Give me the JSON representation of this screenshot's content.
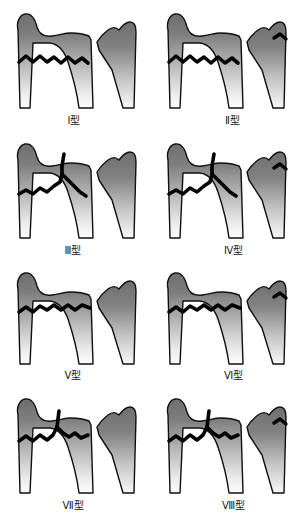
{
  "figure": {
    "title": "",
    "type": "anatomical-classification-diagram",
    "grid": {
      "columns": 2,
      "rows": 4
    },
    "colors": {
      "outline": "#101010",
      "fracture_line": "#000000",
      "bone_fill_top": "#7d7d7d",
      "bone_fill_bottom": "#ffffff",
      "background": "#ffffff",
      "label_text": "#1a1a1a"
    },
    "panels": [
      {
        "index": 1,
        "label": "Ⅰ型",
        "numeral": "Ⅰ",
        "fracture_description": "transverse jagged split across lateral plateau, single fragment",
        "fracture_path": "M 12,60 L 20,55 L 27,60 L 34,54 L 41,60 L 48,55 L 55,61 L 62,56 L 69,62 L 76,57 L 83,63 L 90,58 L 97,63 L 104,60",
        "fibula_fracture_path": ""
      },
      {
        "index": 2,
        "label": "Ⅱ型",
        "numeral": "Ⅱ",
        "fracture_description": "transverse plateau split plus associated fibular head fracture",
        "fracture_path": "M 12,60 L 20,55 L 27,60 L 34,54 L 41,60 L 48,55 L 55,61 L 62,56 L 69,62 L 76,57 L 83,63 L 90,58 L 97,63 L 104,60",
        "fibula_fracture_path": "M 124,38 L 131,34 L 138,39 L 144,35"
      },
      {
        "index": 3,
        "label": "Ⅲ型",
        "numeral": "Ⅲ",
        "fracture_description": "oblique medial split running up to the intercondylar eminence",
        "fracture_path": "M 12,62 L 20,58 L 27,62 L 34,57 L 41,60 L 48,54 L 55,58 L 62,52 L 66,44 L 68,36 L 71,28 L 78,35 L 85,44 L 92,52 L 99,58 L 104,62",
        "fibula_fracture_path": ""
      },
      {
        "index": 4,
        "label": "Ⅳ型",
        "numeral": "Ⅳ",
        "fracture_description": "oblique medial split to eminence plus fibular head fracture",
        "fracture_path": "M 12,62 L 20,58 L 27,62 L 34,57 L 41,60 L 48,54 L 55,58 L 62,52 L 66,44 L 68,36 L 71,28 L 78,35 L 85,44 L 92,52 L 99,58 L 104,62",
        "fibula_fracture_path": "M 124,38 L 131,34 L 138,39 L 144,35"
      },
      {
        "index": 5,
        "label": "Ⅴ型",
        "numeral": "Ⅴ",
        "fracture_description": "high transverse subchondral split just below the plateau surface",
        "fracture_path": "M 12,52 L 19,47 L 26,52 L 33,46 L 40,50 L 47,44 L 54,48 L 61,43 L 68,48 L 75,43 L 82,48 L 89,43 L 96,47 L 104,44",
        "fibula_fracture_path": ""
      },
      {
        "index": 6,
        "label": "Ⅵ型",
        "numeral": "Ⅵ",
        "fracture_description": "high transverse subchondral split plus fibular head fracture",
        "fracture_path": "M 12,52 L 19,47 L 26,52 L 33,46 L 40,50 L 47,44 L 54,48 L 61,43 L 68,48 L 75,43 L 82,48 L 89,43 L 96,47 L 104,44",
        "fibula_fracture_path": "M 124,38 L 131,34 L 138,39 L 144,35"
      },
      {
        "index": 7,
        "label": "Ⅶ型",
        "numeral": "Ⅶ",
        "fracture_description": "transverse split with separate central eminence wedge fragment",
        "fracture_path": "M 12,56 L 19,51 L 26,56 L 33,50 L 40,54 L 47,48 L 54,52 L 60,46 L 64,38 L 67,30 L 73,36 L 80,44 L 87,50 L 94,54 L 104,52",
        "fibula_fracture_path": ""
      },
      {
        "index": 8,
        "label": "Ⅷ型",
        "numeral": "Ⅷ",
        "fracture_description": "transverse split with central wedge fragment plus fibular head fracture",
        "fracture_path": "M 12,56 L 19,51 L 26,56 L 33,50 L 40,54 L 47,48 L 54,52 L 60,46 L 64,38 L 67,30 L 73,36 L 80,44 L 87,50 L 94,54 L 104,52",
        "fibula_fracture_path": "M 124,38 L 131,34 L 138,39 L 144,35"
      }
    ]
  }
}
